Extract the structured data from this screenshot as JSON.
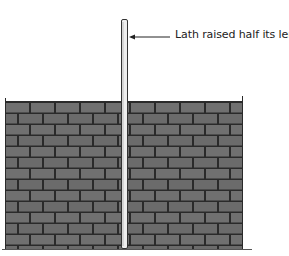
{
  "diagram": {
    "title": "",
    "annotation": {
      "label": "Lath raised half its length",
      "arrow_direction": "left",
      "points_to": "lath"
    },
    "wall": {
      "description": "Brick wall",
      "brick_fill": "#707070",
      "mortar_color": "#2a2a2a",
      "courses": 13
    },
    "lath": {
      "description": "Vertical lath inserted in wall, raised half its length",
      "fill": "#e8e8e8",
      "outline": "#333333"
    }
  }
}
